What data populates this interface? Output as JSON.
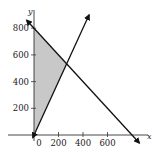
{
  "chart_data": {
    "type": "line",
    "title": "",
    "xlabel": "x",
    "ylabel": "y",
    "xlim": [
      -30,
      850
    ],
    "ylim": [
      -60,
      920
    ],
    "grid": false,
    "x_ticks": [
      0,
      200,
      400,
      600
    ],
    "x_tick_labels": [
      "0",
      "200",
      "400",
      "600"
    ],
    "y_ticks": [
      200,
      400,
      600,
      800
    ],
    "y_tick_labels": [
      "200",
      "400",
      "600",
      "800"
    ],
    "series": [
      {
        "name": "x + y = 800",
        "equation": "y = 800 - x",
        "points": [
          [
            -60,
            860
          ],
          [
            0,
            800
          ],
          [
            800,
            0
          ],
          [
            860,
            -60
          ]
        ],
        "color": "#111111",
        "arrows": "both"
      },
      {
        "name": "y = 2x",
        "equation": "y = 2x",
        "points": [
          [
            -10,
            -20
          ],
          [
            0,
            0
          ],
          [
            266.7,
            533.3
          ],
          [
            450,
            900
          ]
        ],
        "color": "#111111",
        "arrows": "both"
      }
    ],
    "shaded_region": {
      "description": "feasible region x >= 0, y >= 2x, x + y <= 800",
      "vertices": [
        [
          0,
          0
        ],
        [
          0,
          800
        ],
        [
          266.7,
          533.3
        ]
      ],
      "color": "#c8c8c8"
    },
    "intersection": [
      266.7,
      533.3
    ]
  }
}
